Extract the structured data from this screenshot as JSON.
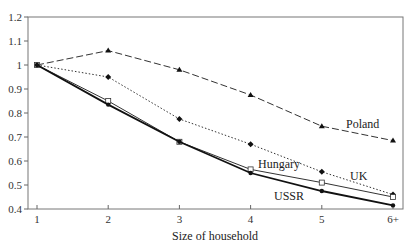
{
  "chart_data": {
    "type": "line",
    "title": "",
    "xlabel": "Size of household",
    "ylabel": "",
    "categories": [
      "1",
      "2",
      "3",
      "4",
      "5",
      "6+"
    ],
    "ylim": [
      0.4,
      1.2
    ],
    "yticks": [
      0.4,
      0.5,
      0.6,
      0.7,
      0.8,
      0.9,
      1,
      1.1,
      1.2
    ],
    "ytick_labels": [
      "0.4",
      "0.5",
      "0.6",
      "0.7",
      "0.8",
      "0.9",
      "1",
      "1.1",
      "1.2"
    ],
    "grid": false,
    "legend": "inline labels near line ends",
    "series": [
      {
        "name": "Poland",
        "style": "dashed",
        "marker": "triangle",
        "values": [
          1.0,
          1.06,
          0.98,
          0.875,
          0.745,
          0.685
        ]
      },
      {
        "name": "UK",
        "style": "dotted",
        "marker": "diamond",
        "values": [
          1.0,
          0.95,
          0.775,
          0.67,
          0.555,
          0.46
        ]
      },
      {
        "name": "Hungary",
        "style": "solid",
        "marker": "open-square",
        "values": [
          1.0,
          0.85,
          0.68,
          0.565,
          0.51,
          0.45
        ]
      },
      {
        "name": "USSR",
        "style": "solid-thick",
        "marker": "filled-circle",
        "values": [
          1.0,
          0.835,
          0.68,
          0.55,
          0.475,
          0.415
        ]
      }
    ]
  },
  "labels": {
    "xlabel": "Size of household",
    "poland": "Poland",
    "uk": "UK",
    "hungary": "Hungary",
    "ussr": "USSR"
  }
}
